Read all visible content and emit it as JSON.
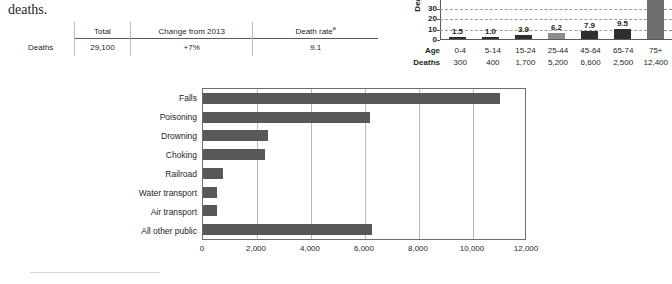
{
  "body_text": "deaths.",
  "summary_table": {
    "row_label": "Deaths",
    "columns": [
      {
        "header": "Total",
        "header_sup": "",
        "value": "29,100"
      },
      {
        "header": "Change from 2013",
        "header_sup": "",
        "value": "+7%"
      },
      {
        "header": "Death rate",
        "header_sup": "a",
        "value": "9.1"
      }
    ]
  },
  "chart_data": [
    {
      "type": "bar",
      "name": "death-rate-by-age",
      "title": "",
      "ylabel": "Death",
      "orientation": "vertical",
      "categories": [
        "0-4",
        "5-14",
        "15-24",
        "25-44",
        "45-64",
        "65-74",
        "75+"
      ],
      "values": [
        1.5,
        1.0,
        3.9,
        6.2,
        7.9,
        9.5,
        38.0
      ],
      "value_labels": [
        "1.5",
        "1.0",
        "3.9",
        "6.2",
        "7.9",
        "9.5",
        ""
      ],
      "bar_colors": [
        "#2f2f2f",
        "#2f2f2f",
        "#2f2f2f",
        "#8d8d8d",
        "#2f2f2f",
        "#2f2f2f",
        "#6e6e6e"
      ],
      "ylim": [
        0,
        40
      ],
      "yticks": [
        0,
        10,
        20,
        30
      ],
      "ytick_labels": [
        "0",
        "10",
        "20",
        "30"
      ],
      "grid": true,
      "row_labels": [
        "Age",
        "Deaths"
      ],
      "deaths": [
        "300",
        "400",
        "1,700",
        "5,200",
        "6,600",
        "2,500",
        "12,400"
      ]
    },
    {
      "type": "bar",
      "name": "deaths-by-cause",
      "title": "",
      "xlabel": "",
      "ylabel": "",
      "orientation": "horizontal",
      "categories": [
        "Falls",
        "Poisoning",
        "Drowning",
        "Choking",
        "Railroad",
        "Water transport",
        "Air transport",
        "All other public"
      ],
      "values": [
        11000,
        6200,
        2400,
        2300,
        750,
        500,
        500,
        6250
      ],
      "bar_color": "#58585b",
      "xlim": [
        0,
        12000
      ],
      "xticks": [
        0,
        2000,
        4000,
        6000,
        8000,
        10000,
        12000
      ],
      "xtick_labels": [
        "0",
        "2,000",
        "4,000",
        "6,000",
        "8,000",
        "10,000",
        "12,000"
      ],
      "grid": true
    }
  ]
}
